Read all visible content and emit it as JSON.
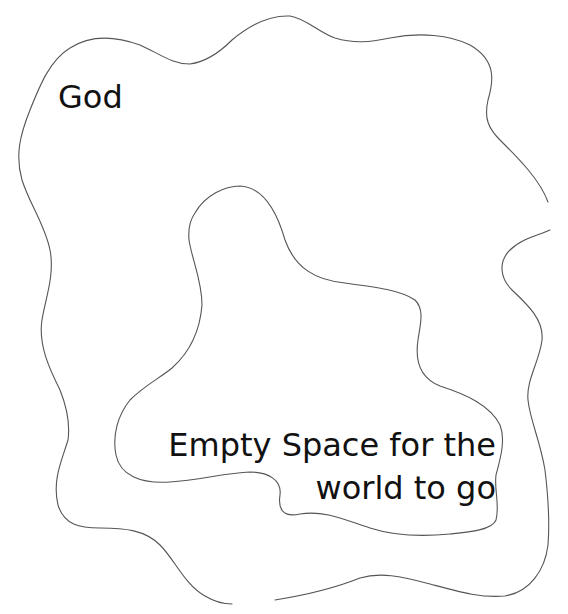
{
  "diagram": {
    "outer_region": {
      "label": "God",
      "stroke_color": "#555555"
    },
    "inner_region": {
      "label_line1": "Empty Space for the",
      "label_line2": "world to go",
      "stroke_color": "#555555"
    },
    "background_color": "#ffffff",
    "text_color": "#111111"
  }
}
